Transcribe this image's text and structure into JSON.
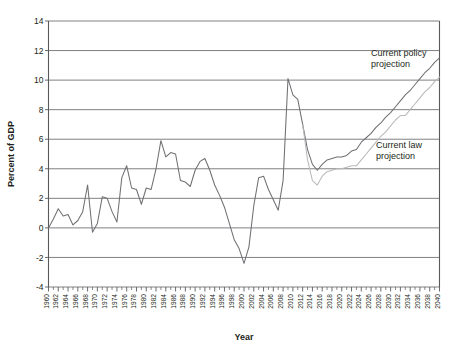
{
  "chart_data": {
    "type": "line",
    "title": "",
    "xlabel": "Year",
    "ylabel": "Percent of GDP",
    "xlim": [
      1960,
      2040
    ],
    "ylim": [
      -4,
      14
    ],
    "yticks": [
      -4,
      -2,
      0,
      2,
      4,
      6,
      8,
      10,
      12,
      14
    ],
    "ytick_labels": [
      "-4",
      "-2",
      "0",
      "2",
      "4",
      "6",
      "8",
      "10",
      "12",
      "14"
    ],
    "xticks": [
      1960,
      1962,
      1964,
      1966,
      1968,
      1970,
      1972,
      1974,
      1976,
      1978,
      1980,
      1982,
      1984,
      1986,
      1988,
      1990,
      1992,
      1994,
      1996,
      1998,
      2000,
      2002,
      2004,
      2006,
      2008,
      2010,
      2012,
      2014,
      2016,
      2018,
      2020,
      2022,
      2024,
      2026,
      2028,
      2030,
      2032,
      2034,
      2036,
      2038,
      2040
    ],
    "xtick_labels": [
      "1960",
      "1962",
      "1964",
      "1966",
      "1968",
      "1970",
      "1972",
      "1974",
      "1976",
      "1978",
      "1980",
      "1982",
      "1984",
      "1986",
      "1988",
      "1990",
      "1992",
      "1994",
      "1996",
      "1998",
      "2000",
      "2002",
      "2004",
      "2006",
      "2008",
      "2010",
      "2012",
      "2014",
      "2016",
      "2018",
      "2020",
      "2022",
      "2024",
      "2026",
      "2028",
      "2030",
      "2032",
      "2034",
      "2036",
      "2038",
      "2040"
    ],
    "grid": "horizontal",
    "legend_position": "inline-annotation",
    "series": [
      {
        "name": "Historical",
        "color": "#6f7073",
        "x": [
          1960,
          1961,
          1962,
          1963,
          1964,
          1965,
          1966,
          1967,
          1968,
          1969,
          1970,
          1971,
          1972,
          1973,
          1974,
          1975,
          1976,
          1977,
          1978,
          1979,
          1980,
          1981,
          1982,
          1983,
          1984,
          1985,
          1986,
          1987,
          1988,
          1989,
          1990,
          1991,
          1992,
          1993,
          1994,
          1995,
          1996,
          1997,
          1998,
          1999,
          2000,
          2001,
          2002,
          2003,
          2004,
          2005,
          2006,
          2007,
          2008,
          2009,
          2010,
          2011,
          2012
        ],
        "values": [
          0.0,
          0.6,
          1.3,
          0.8,
          0.9,
          0.2,
          0.5,
          1.1,
          2.9,
          -0.3,
          0.3,
          2.1,
          2.0,
          1.1,
          0.4,
          3.4,
          4.2,
          2.7,
          2.6,
          1.6,
          2.7,
          2.6,
          4.0,
          5.9,
          4.8,
          5.1,
          5.0,
          3.2,
          3.1,
          2.8,
          3.9,
          4.5,
          4.7,
          3.9,
          2.9,
          2.2,
          1.4,
          0.3,
          -0.8,
          -1.4,
          -2.4,
          -1.3,
          1.5,
          3.4,
          3.5,
          2.6,
          1.9,
          1.2,
          3.2,
          10.1,
          9.0,
          8.7,
          7.0
        ]
      },
      {
        "name": "Current policy projection",
        "color": "#6f7073",
        "x": [
          2012,
          2013,
          2014,
          2015,
          2016,
          2017,
          2018,
          2019,
          2020,
          2021,
          2022,
          2023,
          2024,
          2025,
          2026,
          2027,
          2028,
          2029,
          2030,
          2031,
          2032,
          2033,
          2034,
          2035,
          2036,
          2037,
          2038,
          2039,
          2040
        ],
        "values": [
          7.0,
          5.3,
          4.3,
          3.9,
          4.3,
          4.6,
          4.7,
          4.8,
          4.8,
          4.9,
          5.2,
          5.3,
          5.8,
          6.1,
          6.4,
          6.8,
          7.1,
          7.5,
          7.8,
          8.2,
          8.6,
          9.0,
          9.3,
          9.7,
          10.1,
          10.5,
          10.8,
          11.2,
          11.5
        ]
      },
      {
        "name": "Current law projection",
        "color": "#b8b9bb",
        "x": [
          2012,
          2013,
          2014,
          2015,
          2016,
          2017,
          2018,
          2019,
          2020,
          2021,
          2022,
          2023,
          2024,
          2025,
          2026,
          2027,
          2028,
          2029,
          2030,
          2031,
          2032,
          2033,
          2034,
          2035,
          2036,
          2037,
          2038,
          2039,
          2040
        ],
        "values": [
          7.0,
          4.6,
          3.2,
          2.9,
          3.5,
          3.8,
          3.9,
          4.0,
          4.0,
          4.1,
          4.2,
          4.2,
          4.6,
          5.0,
          5.4,
          5.8,
          6.2,
          6.5,
          6.9,
          7.3,
          7.6,
          7.6,
          8.0,
          8.4,
          8.8,
          9.2,
          9.5,
          9.9,
          10.2
        ]
      }
    ],
    "annotations": [
      {
        "name": "current-policy-projection-label",
        "lines": [
          "Current policy",
          "projection"
        ],
        "x": 2026,
        "y": 11.6
      },
      {
        "name": "current-law-projection-label",
        "lines": [
          "Current law",
          "projection"
        ],
        "x": 2027,
        "y": 5.4
      }
    ]
  }
}
